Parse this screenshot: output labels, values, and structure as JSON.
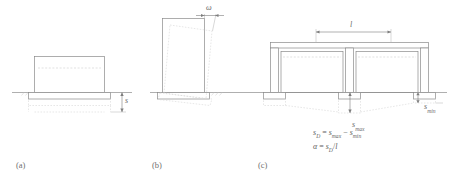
{
  "figure": {
    "type": "engineering-diagram",
    "ground_line_label": "ground-surface"
  },
  "panels": [
    {
      "id": "a",
      "letter": "(a)",
      "name": "uniform-settlement",
      "labels": [
        {
          "name": "settlement-s",
          "symbol": "s",
          "subscript": ""
        }
      ]
    },
    {
      "id": "b",
      "letter": "(b)",
      "name": "tilt-rotation",
      "labels": [
        {
          "name": "tilt-omega",
          "symbol": "ω",
          "subscript": ""
        }
      ]
    },
    {
      "id": "c",
      "letter": "(c)",
      "name": "differential-settlement",
      "labels": [
        {
          "name": "span-length",
          "symbol": "l",
          "subscript": ""
        },
        {
          "name": "settlement-max",
          "symbol": "s",
          "subscript": "max"
        },
        {
          "name": "settlement-min",
          "symbol": "s",
          "subscript": "min"
        }
      ],
      "equations": [
        {
          "name": "differential-settlement-equation",
          "lhs_symbol": "s",
          "lhs_sub": "D",
          "eq": "=",
          "t1_symbol": "s",
          "t1_sub": "max",
          "minus": "−",
          "t2_symbol": "s",
          "t2_sub": "min"
        },
        {
          "name": "angular-distortion-equation",
          "lhs_symbol": "α",
          "lhs_sub": "",
          "eq": "=",
          "t1_symbol": "s",
          "t1_sub": "D",
          "minus": "/",
          "t2_symbol": "l",
          "t2_sub": ""
        }
      ]
    }
  ],
  "colors": {
    "outline": "#8a8a8a",
    "ground": "#9a9a9a",
    "dashed": "#c9c9c9",
    "text": "#6b6b6b",
    "fill": "#ffffff"
  }
}
